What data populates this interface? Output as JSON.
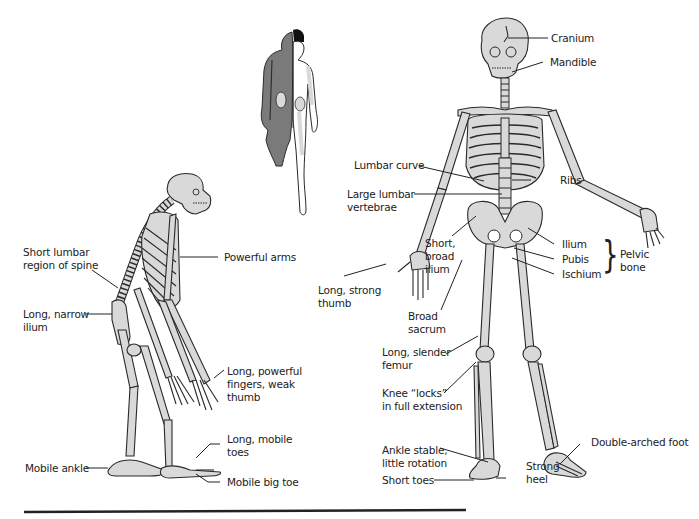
{
  "figure": {
    "chimpanzee_labels": [
      {
        "id": "short-lumbar",
        "text": "Short lumbar\nregion of spine"
      },
      {
        "id": "powerful-arms",
        "text": "Powerful arms"
      },
      {
        "id": "long-narrow-ilium",
        "text": "Long, narrow\nilium"
      },
      {
        "id": "long-powerful-fingers",
        "text": "Long, powerful\nfingers, weak\nthumb"
      },
      {
        "id": "long-mobile-toes",
        "text": "Long, mobile\ntoes"
      },
      {
        "id": "mobile-ankle",
        "text": "Mobile ankle"
      },
      {
        "id": "mobile-big-toe",
        "text": "Mobile big toe"
      }
    ],
    "human_labels": [
      {
        "id": "cranium",
        "text": "Cranium"
      },
      {
        "id": "mandible",
        "text": "Mandible"
      },
      {
        "id": "lumbar-curve",
        "text": "Lumbar curve"
      },
      {
        "id": "ribs",
        "text": "Ribs"
      },
      {
        "id": "large-lumbar-vertebrae",
        "text": "Large lumbar\nvertebrae"
      },
      {
        "id": "short-broad-ilium",
        "text": "Short,\nbroad\nilium"
      },
      {
        "id": "ilium",
        "text": "Ilium"
      },
      {
        "id": "pubis",
        "text": "Pubis"
      },
      {
        "id": "ischium",
        "text": "Ischium"
      },
      {
        "id": "pelvic-bone",
        "text": "Pelvic\nbone"
      },
      {
        "id": "long-strong-thumb",
        "text": "Long, strong\nthumb"
      },
      {
        "id": "broad-sacrum",
        "text": "Broad\nsacrum"
      },
      {
        "id": "long-slender-femur",
        "text": "Long, slender\nfemur"
      },
      {
        "id": "knee-locks",
        "text": "Knee “locks”\nin full extension"
      },
      {
        "id": "ankle-stable",
        "text": "Ankle stable,\nlittle rotation"
      },
      {
        "id": "short-toes",
        "text": "Short toes"
      },
      {
        "id": "strong-heel",
        "text": "Strong\nheel"
      },
      {
        "id": "double-arched-foot",
        "text": "Double-arched foot"
      }
    ],
    "brace_symbol": "}",
    "colors": {
      "bone_fill": "#d9d9d9",
      "outline": "#2a2a2a",
      "ape_fur": "#7a7a7a",
      "background": "#ffffff"
    }
  }
}
